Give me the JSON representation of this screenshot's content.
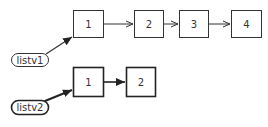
{
  "diagram": {
    "type": "linked-lists",
    "lists": [
      {
        "name": "listv1",
        "nodes": [
          "1",
          "2",
          "3",
          "4"
        ],
        "style": "thin"
      },
      {
        "name": "listv2",
        "nodes": [
          "1",
          "2"
        ],
        "style": "bold"
      }
    ],
    "colors": {
      "stroke": "#333333",
      "fill": "#ffffff",
      "text": "#333333"
    }
  }
}
